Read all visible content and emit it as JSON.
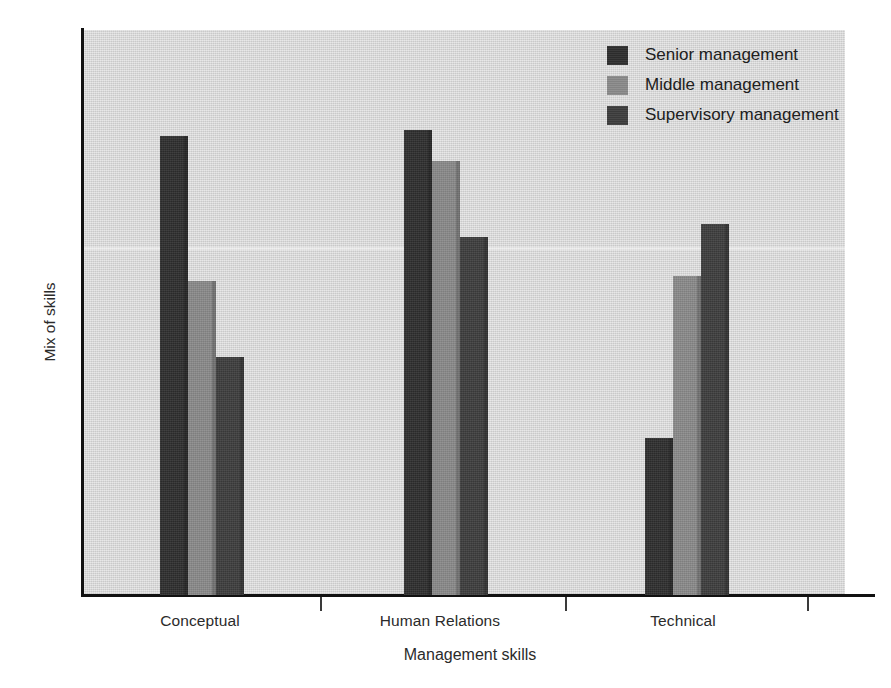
{
  "chart_data": {
    "type": "bar",
    "title": "",
    "xlabel": "Management skills",
    "ylabel": "Mix of skills",
    "categories": [
      "Conceptual",
      "Human Relations",
      "Technical"
    ],
    "grid": false,
    "legend_position": "top-right",
    "ylim": [
      0,
      100
    ],
    "y_ticks": [],
    "series": [
      {
        "name": "Senior management",
        "color": "#2e2e2e",
        "values": [
          81.2,
          82.3,
          27.8
        ]
      },
      {
        "name": "Middle management",
        "color": "#8a8a8a",
        "values": [
          55.6,
          76.8,
          56.5
        ]
      },
      {
        "name": "Supervisory management",
        "color": "#3d3d3d",
        "values": [
          42.1,
          63.4,
          65.7
        ]
      }
    ]
  },
  "legend": {
    "items": [
      {
        "label": "Senior management",
        "color": "#2e2e2e"
      },
      {
        "label": "Middle management",
        "color": "#8a8a8a"
      },
      {
        "label": "Supervisory management",
        "color": "#3d3d3d"
      }
    ]
  },
  "axes": {
    "x_title": "Management skills",
    "y_title": "Mix of skills",
    "x_categories": [
      "Conceptual",
      "Human Relations",
      "Technical"
    ]
  },
  "colors": {
    "page_background": "#ffffff",
    "plot_background": "#d4d4d4",
    "axis_line": "#111111",
    "text": "#2b2b2b"
  }
}
